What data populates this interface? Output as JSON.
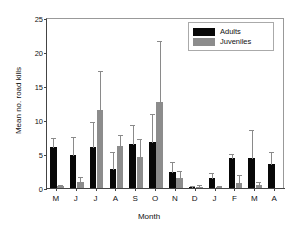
{
  "chart_data": {
    "type": "bar",
    "title": "",
    "xlabel": "Month",
    "ylabel": "Mean no. road kills",
    "categories": [
      "M",
      "J",
      "J",
      "A",
      "S",
      "O",
      "N",
      "D",
      "J",
      "F",
      "M",
      "A"
    ],
    "ylim": [
      0,
      25
    ],
    "yticks": [
      0,
      5,
      10,
      15,
      20,
      25
    ],
    "grid": false,
    "legend_position": "top-right",
    "error_bars": "upper",
    "series": [
      {
        "name": "Adults",
        "color": "#080808",
        "values": [
          6.0,
          4.9,
          6.1,
          2.8,
          6.5,
          6.7,
          2.3,
          0.2,
          1.5,
          4.4,
          4.4,
          3.6
        ],
        "errors_upper": [
          7.5,
          7.7,
          9.8,
          5.4,
          9.4,
          11.0,
          4.0,
          0.5,
          2.4,
          5.2,
          8.7,
          5.5
        ]
      },
      {
        "name": "Juveniles",
        "color": "#8c8c8c",
        "values": [
          0.25,
          0.9,
          11.5,
          6.2,
          4.5,
          12.6,
          1.4,
          0.2,
          0.1,
          0.8,
          0.4,
          0.0
        ],
        "errors_upper": [
          0.6,
          1.8,
          17.3,
          8.0,
          7.4,
          21.7,
          2.7,
          0.6,
          0.4,
          2.0,
          1.1,
          0.0
        ]
      }
    ]
  },
  "legend": {
    "items": [
      {
        "label": "Adults"
      },
      {
        "label": "Juveniles"
      }
    ]
  }
}
